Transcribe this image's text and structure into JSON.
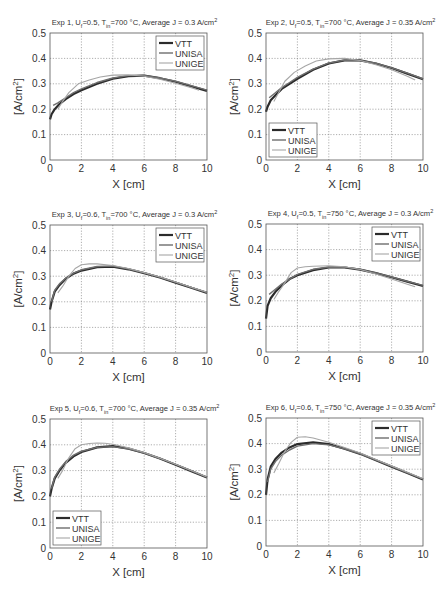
{
  "figure": {
    "colors": {
      "VTT": "#2b2b2b",
      "UNISA": "#6e6e6e",
      "UNIGE": "#a6a6a6",
      "axis": "#555555",
      "grid": "#777777"
    }
  },
  "chart_data": [
    {
      "type": "line",
      "title_parts": {
        "exp": "Exp 1",
        "u": "0.5",
        "t": "700",
        "j": "0.3"
      },
      "title": "Exp 1, Uf=0.5, Tin=700 °C, Average J = 0.3 A/cm2",
      "xlabel": "X [cm]",
      "ylabel": "[A/cm2]",
      "xlim": [
        0,
        10
      ],
      "ylim": [
        0,
        0.5
      ],
      "xticks": [
        "0",
        "2",
        "4",
        "6",
        "8",
        "10"
      ],
      "yticks": [
        "0",
        "0.1",
        "0.2",
        "0.3",
        "0.4",
        "0.5"
      ],
      "grid": true,
      "legend": "top-right",
      "series": [
        {
          "name": "VTT",
          "x": [
            0,
            0.1,
            0.3,
            0.6,
            1,
            1.5,
            2,
            3,
            4,
            5,
            6,
            7,
            8,
            9,
            10
          ],
          "y": [
            0.16,
            0.18,
            0.2,
            0.22,
            0.24,
            0.26,
            0.275,
            0.3,
            0.32,
            0.33,
            0.332,
            0.322,
            0.308,
            0.29,
            0.272
          ]
        },
        {
          "name": "UNISA",
          "x": [
            0.2,
            0.5,
            1,
            1.5,
            2,
            3,
            4,
            5,
            6,
            7,
            8,
            9,
            10
          ],
          "y": [
            0.215,
            0.225,
            0.245,
            0.265,
            0.28,
            0.305,
            0.323,
            0.332,
            0.333,
            0.323,
            0.31,
            0.293,
            0.275
          ]
        },
        {
          "name": "UNIGE",
          "x": [
            0.5,
            0.8,
            1.2,
            1.8,
            2.5,
            3.2,
            4,
            5,
            6,
            7,
            8,
            9,
            9.5
          ],
          "y": [
            0.2,
            0.23,
            0.265,
            0.3,
            0.315,
            0.327,
            0.334,
            0.335,
            0.33,
            0.318,
            0.302,
            0.285,
            0.275
          ]
        }
      ]
    },
    {
      "type": "line",
      "title_parts": {
        "exp": "Exp 2",
        "u": "0.5",
        "t": "700",
        "j": "0.35"
      },
      "title": "Exp 2, Uf=0.5, Tin=700 °C, Average J = 0.35 A/cm2",
      "xlabel": "X [cm]",
      "ylabel": "[A/cm2]",
      "xlim": [
        0,
        10
      ],
      "ylim": [
        0,
        0.5
      ],
      "xticks": [
        "0",
        "2",
        "4",
        "6",
        "8",
        "10"
      ],
      "yticks": [
        "0",
        "0.1",
        "0.2",
        "0.3",
        "0.4",
        "0.5"
      ],
      "grid": true,
      "legend": "bottom-left",
      "series": [
        {
          "name": "VTT",
          "x": [
            0,
            0.1,
            0.3,
            0.6,
            1,
            1.5,
            2,
            3,
            4,
            5,
            6,
            7,
            8,
            9,
            10
          ],
          "y": [
            0.19,
            0.21,
            0.235,
            0.255,
            0.28,
            0.3,
            0.32,
            0.355,
            0.38,
            0.392,
            0.392,
            0.38,
            0.362,
            0.34,
            0.318
          ]
        },
        {
          "name": "UNISA",
          "x": [
            0.2,
            0.5,
            1,
            1.5,
            2,
            3,
            4,
            5,
            6,
            7,
            8,
            9,
            10
          ],
          "y": [
            0.245,
            0.26,
            0.285,
            0.305,
            0.325,
            0.358,
            0.382,
            0.393,
            0.392,
            0.381,
            0.363,
            0.342,
            0.32
          ]
        },
        {
          "name": "UNIGE",
          "x": [
            0.5,
            0.8,
            1.2,
            1.8,
            2.5,
            3.2,
            4,
            5,
            6,
            7,
            8,
            9,
            9.5
          ],
          "y": [
            0.23,
            0.265,
            0.31,
            0.345,
            0.37,
            0.39,
            0.398,
            0.4,
            0.392,
            0.375,
            0.355,
            0.33,
            0.315
          ]
        }
      ]
    },
    {
      "type": "line",
      "title_parts": {
        "exp": "Exp 3",
        "u": "0.6",
        "t": "700",
        "j": "0.3"
      },
      "title": "Exp 3, Uf=0.6, Tin=700 °C, Average J = 0.3 A/cm2",
      "xlabel": "X [cm]",
      "ylabel": "[A/cm2]",
      "xlim": [
        0,
        10
      ],
      "ylim": [
        0,
        0.5
      ],
      "xticks": [
        "0",
        "2",
        "4",
        "6",
        "8",
        "10"
      ],
      "yticks": [
        "0",
        "0.1",
        "0.2",
        "0.3",
        "0.4",
        "0.5"
      ],
      "grid": true,
      "legend": "top-right",
      "series": [
        {
          "name": "VTT",
          "x": [
            0,
            0.1,
            0.3,
            0.6,
            1,
            1.5,
            2,
            3,
            4,
            5,
            6,
            7,
            8,
            9,
            10
          ],
          "y": [
            0.17,
            0.2,
            0.24,
            0.265,
            0.29,
            0.31,
            0.322,
            0.335,
            0.337,
            0.327,
            0.312,
            0.295,
            0.275,
            0.255,
            0.235
          ]
        },
        {
          "name": "UNISA",
          "x": [
            0.1,
            0.3,
            0.6,
            1,
            1.5,
            2,
            3,
            4,
            5,
            6,
            7,
            8,
            9,
            10
          ],
          "y": [
            0.2,
            0.245,
            0.27,
            0.292,
            0.312,
            0.325,
            0.338,
            0.34,
            0.328,
            0.313,
            0.296,
            0.276,
            0.256,
            0.236
          ]
        },
        {
          "name": "UNIGE",
          "x": [
            0.5,
            0.8,
            1.2,
            1.6,
            2,
            2.5,
            3,
            4,
            5,
            6,
            7,
            8,
            9,
            10
          ],
          "y": [
            0.235,
            0.26,
            0.3,
            0.33,
            0.345,
            0.348,
            0.348,
            0.342,
            0.33,
            0.314,
            0.297,
            0.277,
            0.257,
            0.237
          ]
        }
      ]
    },
    {
      "type": "line",
      "title_parts": {
        "exp": "Exp 4",
        "u": "0.5",
        "t": "750",
        "j": "0.3"
      },
      "title": "Exp 4, Uf=0.5, Tin=750 °C, Average J = 0.3 A/cm2",
      "xlabel": "X [cm]",
      "ylabel": "[A/cm2]",
      "xlim": [
        0,
        10
      ],
      "ylim": [
        0,
        0.5
      ],
      "xticks": [
        "0",
        "2",
        "4",
        "6",
        "8",
        "10"
      ],
      "yticks": [
        "0",
        "0.1",
        "0.2",
        "0.3",
        "0.4",
        "0.5"
      ],
      "grid": true,
      "legend": "top-right",
      "series": [
        {
          "name": "VTT",
          "x": [
            0,
            0.1,
            0.3,
            0.6,
            1,
            1.5,
            2,
            3,
            4,
            5,
            6,
            7,
            8,
            9,
            10
          ],
          "y": [
            0.13,
            0.18,
            0.21,
            0.235,
            0.26,
            0.285,
            0.3,
            0.32,
            0.33,
            0.33,
            0.322,
            0.308,
            0.292,
            0.275,
            0.258
          ]
        },
        {
          "name": "UNISA",
          "x": [
            0.2,
            0.5,
            1,
            1.5,
            2,
            3,
            4,
            5,
            6,
            7,
            8,
            9,
            10
          ],
          "y": [
            0.225,
            0.24,
            0.265,
            0.285,
            0.303,
            0.323,
            0.332,
            0.331,
            0.323,
            0.309,
            0.293,
            0.276,
            0.26
          ]
        },
        {
          "name": "UNIGE",
          "x": [
            0.5,
            0.8,
            1.2,
            1.6,
            2,
            2.5,
            3,
            4,
            5,
            6,
            7,
            8,
            9,
            9.5
          ],
          "y": [
            0.205,
            0.235,
            0.27,
            0.31,
            0.328,
            0.333,
            0.335,
            0.337,
            0.333,
            0.322,
            0.305,
            0.285,
            0.265,
            0.255
          ]
        }
      ]
    },
    {
      "type": "line",
      "title_parts": {
        "exp": "Exp 5",
        "u": "0.6",
        "t": "700",
        "j": "0.35"
      },
      "title": "Exp 5, Uf=0.6, Tin=700 °C, Average J = 0.35 A/cm2",
      "xlabel": "X [cm]",
      "ylabel": "[A/cm2]",
      "xlim": [
        0,
        10
      ],
      "ylim": [
        0,
        0.5
      ],
      "xticks": [
        "0",
        "2",
        "4",
        "6",
        "8",
        "10"
      ],
      "yticks": [
        "0",
        "0.1",
        "0.2",
        "0.3",
        "0.4",
        "0.5"
      ],
      "grid": true,
      "legend": "bottom-left",
      "series": [
        {
          "name": "VTT",
          "x": [
            0,
            0.1,
            0.3,
            0.6,
            1,
            1.5,
            2,
            3,
            4,
            5,
            6,
            7,
            8,
            9,
            10
          ],
          "y": [
            0.2,
            0.23,
            0.27,
            0.3,
            0.33,
            0.355,
            0.372,
            0.39,
            0.395,
            0.385,
            0.368,
            0.347,
            0.323,
            0.298,
            0.273
          ]
        },
        {
          "name": "UNISA",
          "x": [
            0.1,
            0.3,
            0.6,
            1,
            1.5,
            2,
            3,
            4,
            5,
            6,
            7,
            8,
            9,
            10
          ],
          "y": [
            0.23,
            0.275,
            0.305,
            0.335,
            0.36,
            0.375,
            0.39,
            0.393,
            0.384,
            0.368,
            0.347,
            0.324,
            0.299,
            0.274
          ]
        },
        {
          "name": "UNIGE",
          "x": [
            0.5,
            0.8,
            1.2,
            1.6,
            2,
            2.5,
            3,
            3.5,
            4,
            5,
            6,
            7,
            8,
            9,
            10
          ],
          "y": [
            0.27,
            0.3,
            0.35,
            0.385,
            0.4,
            0.405,
            0.407,
            0.406,
            0.402,
            0.388,
            0.37,
            0.348,
            0.325,
            0.3,
            0.275
          ]
        }
      ]
    },
    {
      "type": "line",
      "title_parts": {
        "exp": "Exp 6",
        "u": "0.6",
        "t": "750",
        "j": "0.35"
      },
      "title": "Exp 6, Uf=0.6, Tin=750 °C, Average J = 0.35 A/cm2",
      "xlabel": "X [cm]",
      "ylabel": "[A/cm2]",
      "xlim": [
        0,
        10
      ],
      "ylim": [
        0,
        0.5
      ],
      "xticks": [
        "0",
        "2",
        "4",
        "6",
        "8",
        "10"
      ],
      "yticks": [
        "0",
        "0.1",
        "0.2",
        "0.3",
        "0.4",
        "0.5"
      ],
      "grid": true,
      "legend": "top-right",
      "series": [
        {
          "name": "VTT",
          "x": [
            0,
            0.1,
            0.3,
            0.6,
            1,
            1.5,
            2,
            3,
            4,
            5,
            6,
            7,
            8,
            9,
            10
          ],
          "y": [
            0.2,
            0.26,
            0.31,
            0.34,
            0.365,
            0.385,
            0.398,
            0.405,
            0.398,
            0.38,
            0.36,
            0.335,
            0.31,
            0.285,
            0.26
          ]
        },
        {
          "name": "UNISA",
          "x": [
            0.1,
            0.3,
            0.6,
            1,
            1.5,
            2,
            3,
            4,
            5,
            6,
            7,
            8,
            9,
            10
          ],
          "y": [
            0.25,
            0.3,
            0.33,
            0.355,
            0.375,
            0.39,
            0.4,
            0.395,
            0.38,
            0.36,
            0.336,
            0.311,
            0.286,
            0.261
          ]
        },
        {
          "name": "UNIGE",
          "x": [
            0.5,
            0.8,
            1.2,
            1.6,
            2,
            2.5,
            3,
            4,
            5,
            6,
            7,
            8,
            9,
            10
          ],
          "y": [
            0.285,
            0.32,
            0.37,
            0.405,
            0.425,
            0.427,
            0.422,
            0.405,
            0.385,
            0.363,
            0.338,
            0.313,
            0.288,
            0.263
          ]
        }
      ]
    }
  ]
}
